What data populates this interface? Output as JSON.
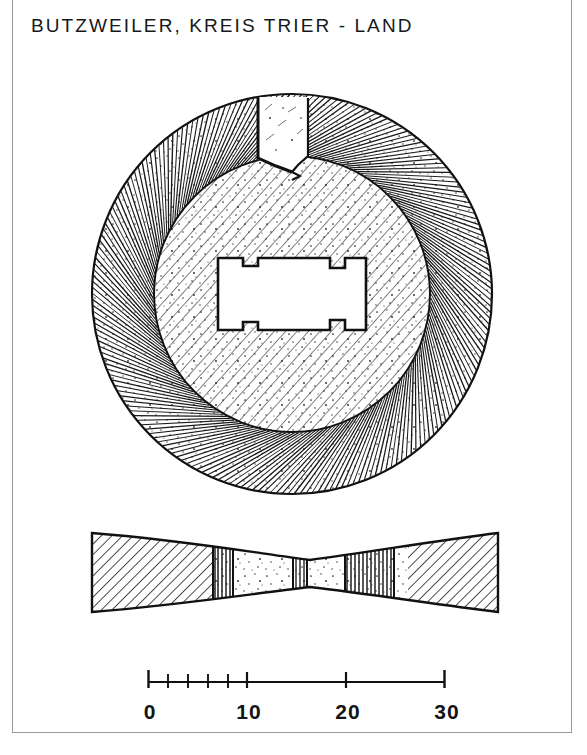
{
  "page": {
    "title": "BUTZWEILER, KREIS TRIER - LAND",
    "background_color": "#ffffff",
    "ink_color": "#111111",
    "frame_color": "#9a9a9a"
  },
  "figure": {
    "caption_site": "BUTZWEILER",
    "caption_district": "KREIS TRIER - LAND",
    "object_type": "perforated stone disc",
    "views": [
      {
        "name": "plan-view",
        "label": "plan view",
        "center_x": 292,
        "center_y": 294,
        "outer_radius": 200,
        "inner_radius": 138,
        "outer_hatch": "radial",
        "inner_hatch": "diagonal",
        "notch": {
          "name": "top-notch",
          "description": "rectangular notch cut into outer ring at top",
          "angle_deg": -90,
          "width": 34,
          "depth": 62
        },
        "perforation": {
          "name": "central-perforation",
          "shape": "hourglass",
          "width": 148,
          "height": 72,
          "center_x": 292,
          "center_y": 294
        }
      },
      {
        "name": "section-view",
        "label": "cross section",
        "left": 92,
        "right": 498,
        "top": 532,
        "bottom": 612,
        "waist_x": 310,
        "waist_top": 552,
        "waist_bottom": 596,
        "hatch": "diagonal",
        "core_texture": "stipple-and-vertical-lines"
      }
    ]
  },
  "scale_bar": {
    "name": "scale-bar",
    "unit": "cm",
    "min": 0,
    "max": 30,
    "bar_left": 148,
    "bar_right": 445,
    "bar_y": 682,
    "major_ticks": [
      0,
      10,
      20,
      30
    ],
    "minor_tick_count": 5,
    "minor_tick_step": 1,
    "labels": [
      "0",
      "10",
      "20",
      "30"
    ],
    "label_positions_px": [
      148,
      247,
      346,
      445
    ]
  },
  "chart_data": {
    "type": "scale",
    "title": "BUTZWEILER, KREIS TRIER - LAND",
    "categories": [
      "0",
      "10",
      "20",
      "30"
    ],
    "values": [
      0,
      10,
      20,
      30
    ],
    "xlabel": "",
    "ylabel": "",
    "xlim": [
      0,
      30
    ],
    "grid": false,
    "legend": "none"
  }
}
